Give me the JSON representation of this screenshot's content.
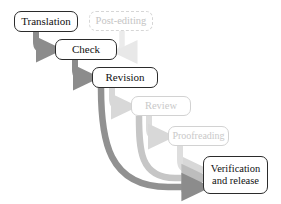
{
  "diagram": {
    "type": "flowchart",
    "colors": {
      "active_border": "#2b2b2b",
      "active_text": "#111111",
      "faded_border": "#d2d2d2",
      "faded_text": "#c9c9c9",
      "arrow_dark": "#8c8c8c",
      "arrow_mid": "#bdbdbd",
      "arrow_light": "#d8d8d8",
      "arrow_lightest": "#e8e8e8",
      "background": "#ffffff"
    },
    "nodes": [
      {
        "id": "translation",
        "label": "Translation",
        "state": "active",
        "x": 14,
        "y": 11,
        "w": 64,
        "h": 21
      },
      {
        "id": "post-editing",
        "label": "Post-editing",
        "state": "faded-dashed",
        "x": 89,
        "y": 11,
        "w": 64,
        "h": 20
      },
      {
        "id": "check",
        "label": "Check",
        "state": "active",
        "x": 55,
        "y": 39,
        "w": 62,
        "h": 21
      },
      {
        "id": "revision",
        "label": "Revision",
        "state": "active",
        "x": 92,
        "y": 67,
        "w": 66,
        "h": 21
      },
      {
        "id": "review",
        "label": "Review",
        "state": "faded-solid",
        "x": 131,
        "y": 96,
        "w": 60,
        "h": 20
      },
      {
        "id": "proofreading",
        "label": "Proofreading",
        "state": "faded-solid",
        "x": 168,
        "y": 126,
        "w": 61,
        "h": 20
      },
      {
        "id": "verification",
        "label_line1": "Verification",
        "label_line2": "and release",
        "state": "active",
        "x": 203,
        "y": 156,
        "w": 65,
        "h": 38
      }
    ],
    "edges": [
      {
        "id": "translation-to-check",
        "from": "translation",
        "to": "check",
        "weight": "dark"
      },
      {
        "id": "check-to-revision",
        "from": "check",
        "to": "revision",
        "weight": "dark"
      },
      {
        "id": "postediting-to-check",
        "from": "post-editing",
        "to": "check",
        "weight": "lightest"
      },
      {
        "id": "revision-to-review",
        "from": "revision",
        "to": "review",
        "weight": "light"
      },
      {
        "id": "review-to-proofreading",
        "from": "review",
        "to": "proofreading",
        "weight": "light"
      },
      {
        "id": "revision-to-verification",
        "from": "revision",
        "to": "verification",
        "weight": "dark"
      },
      {
        "id": "review-to-verification",
        "from": "review",
        "to": "verification",
        "weight": "mid"
      },
      {
        "id": "proofreading-to-verification",
        "from": "proofreading",
        "to": "verification",
        "weight": "light"
      }
    ]
  }
}
